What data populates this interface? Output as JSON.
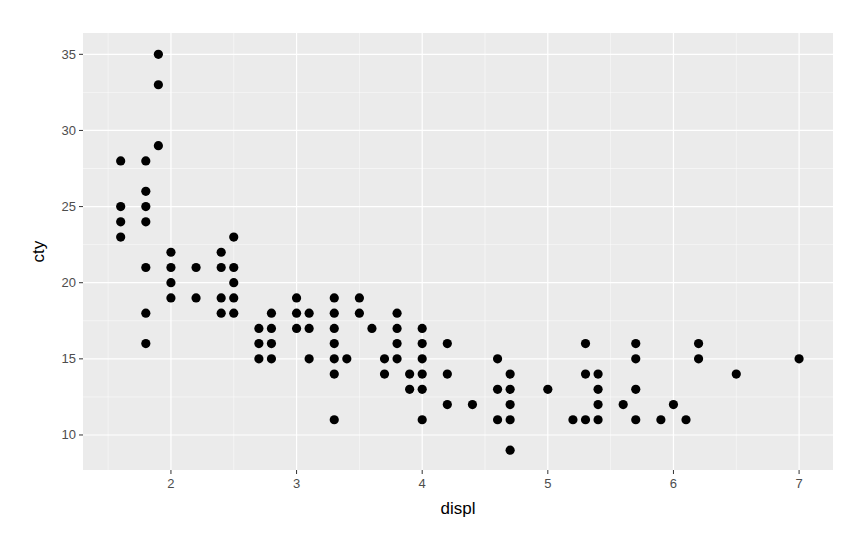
{
  "chart_data": {
    "type": "scatter",
    "title": "",
    "xlabel": "displ",
    "ylabel": "cty",
    "xlim": [
      1.3,
      7.27
    ],
    "ylim": [
      7.7,
      36.4
    ],
    "x_ticks": [
      2,
      3,
      4,
      5,
      6,
      7
    ],
    "y_ticks": [
      10,
      15,
      20,
      25,
      30,
      35
    ],
    "grid": true,
    "legend": null,
    "point_color": "#000000",
    "panel_background": "#ebebeb",
    "grid_color": "#ffffff",
    "points": [
      {
        "x": 1.6,
        "y": 28
      },
      {
        "x": 1.6,
        "y": 25
      },
      {
        "x": 1.6,
        "y": 24
      },
      {
        "x": 1.6,
        "y": 23
      },
      {
        "x": 1.8,
        "y": 28
      },
      {
        "x": 1.8,
        "y": 26
      },
      {
        "x": 1.8,
        "y": 25
      },
      {
        "x": 1.8,
        "y": 24
      },
      {
        "x": 1.8,
        "y": 21
      },
      {
        "x": 1.8,
        "y": 18
      },
      {
        "x": 1.8,
        "y": 16
      },
      {
        "x": 1.9,
        "y": 35
      },
      {
        "x": 1.9,
        "y": 33
      },
      {
        "x": 1.9,
        "y": 29
      },
      {
        "x": 2.0,
        "y": 22
      },
      {
        "x": 2.0,
        "y": 21
      },
      {
        "x": 2.0,
        "y": 20
      },
      {
        "x": 2.0,
        "y": 19
      },
      {
        "x": 2.2,
        "y": 21
      },
      {
        "x": 2.2,
        "y": 19
      },
      {
        "x": 2.4,
        "y": 22
      },
      {
        "x": 2.4,
        "y": 21
      },
      {
        "x": 2.4,
        "y": 19
      },
      {
        "x": 2.4,
        "y": 18
      },
      {
        "x": 2.5,
        "y": 23
      },
      {
        "x": 2.5,
        "y": 21
      },
      {
        "x": 2.5,
        "y": 20
      },
      {
        "x": 2.5,
        "y": 19
      },
      {
        "x": 2.5,
        "y": 18
      },
      {
        "x": 2.7,
        "y": 17
      },
      {
        "x": 2.7,
        "y": 16
      },
      {
        "x": 2.7,
        "y": 15
      },
      {
        "x": 2.8,
        "y": 18
      },
      {
        "x": 2.8,
        "y": 17
      },
      {
        "x": 2.8,
        "y": 16
      },
      {
        "x": 2.8,
        "y": 15
      },
      {
        "x": 3.0,
        "y": 19
      },
      {
        "x": 3.0,
        "y": 18
      },
      {
        "x": 3.0,
        "y": 17
      },
      {
        "x": 3.1,
        "y": 18
      },
      {
        "x": 3.1,
        "y": 17
      },
      {
        "x": 3.1,
        "y": 15
      },
      {
        "x": 3.3,
        "y": 19
      },
      {
        "x": 3.3,
        "y": 18
      },
      {
        "x": 3.3,
        "y": 17
      },
      {
        "x": 3.3,
        "y": 16
      },
      {
        "x": 3.3,
        "y": 15
      },
      {
        "x": 3.3,
        "y": 14
      },
      {
        "x": 3.3,
        "y": 11
      },
      {
        "x": 3.4,
        "y": 15
      },
      {
        "x": 3.5,
        "y": 19
      },
      {
        "x": 3.5,
        "y": 18
      },
      {
        "x": 3.6,
        "y": 17
      },
      {
        "x": 3.7,
        "y": 15
      },
      {
        "x": 3.7,
        "y": 14
      },
      {
        "x": 3.8,
        "y": 18
      },
      {
        "x": 3.8,
        "y": 17
      },
      {
        "x": 3.8,
        "y": 16
      },
      {
        "x": 3.8,
        "y": 15
      },
      {
        "x": 3.9,
        "y": 14
      },
      {
        "x": 3.9,
        "y": 13
      },
      {
        "x": 4.0,
        "y": 17
      },
      {
        "x": 4.0,
        "y": 16
      },
      {
        "x": 4.0,
        "y": 15
      },
      {
        "x": 4.0,
        "y": 14
      },
      {
        "x": 4.0,
        "y": 13
      },
      {
        "x": 4.0,
        "y": 11
      },
      {
        "x": 4.2,
        "y": 16
      },
      {
        "x": 4.2,
        "y": 14
      },
      {
        "x": 4.2,
        "y": 12
      },
      {
        "x": 4.4,
        "y": 12
      },
      {
        "x": 4.6,
        "y": 15
      },
      {
        "x": 4.6,
        "y": 13
      },
      {
        "x": 4.6,
        "y": 11
      },
      {
        "x": 4.7,
        "y": 14
      },
      {
        "x": 4.7,
        "y": 13
      },
      {
        "x": 4.7,
        "y": 12
      },
      {
        "x": 4.7,
        "y": 11
      },
      {
        "x": 4.7,
        "y": 9
      },
      {
        "x": 5.0,
        "y": 13
      },
      {
        "x": 5.2,
        "y": 11
      },
      {
        "x": 5.3,
        "y": 16
      },
      {
        "x": 5.3,
        "y": 14
      },
      {
        "x": 5.3,
        "y": 11
      },
      {
        "x": 5.4,
        "y": 14
      },
      {
        "x": 5.4,
        "y": 13
      },
      {
        "x": 5.4,
        "y": 12
      },
      {
        "x": 5.4,
        "y": 11
      },
      {
        "x": 5.6,
        "y": 12
      },
      {
        "x": 5.7,
        "y": 16
      },
      {
        "x": 5.7,
        "y": 15
      },
      {
        "x": 5.7,
        "y": 13
      },
      {
        "x": 5.7,
        "y": 11
      },
      {
        "x": 5.9,
        "y": 11
      },
      {
        "x": 6.0,
        "y": 12
      },
      {
        "x": 6.1,
        "y": 11
      },
      {
        "x": 6.2,
        "y": 16
      },
      {
        "x": 6.2,
        "y": 15
      },
      {
        "x": 6.5,
        "y": 14
      },
      {
        "x": 7.0,
        "y": 15
      }
    ]
  }
}
